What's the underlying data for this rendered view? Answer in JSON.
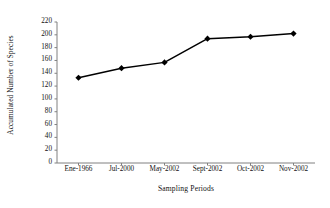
{
  "chart_data": {
    "type": "line",
    "title": "",
    "subtitle": "",
    "xlabel": "Sampling Periods",
    "ylabel": "Accumulated Number of Species",
    "categories": [
      "Ene-1966",
      "Jul-2000",
      "May-2002",
      "Sept-2002",
      "Oct-2002",
      "Nov-2002"
    ],
    "values": [
      133,
      148,
      157,
      194,
      197,
      202
    ],
    "series": [
      {
        "name": "Accumulated Number of Species",
        "values": [
          133,
          148,
          157,
          194,
          197,
          202
        ]
      }
    ],
    "ylim": [
      0,
      220
    ],
    "yticks": [
      0,
      20,
      40,
      60,
      80,
      100,
      120,
      140,
      160,
      180,
      200,
      220
    ],
    "ytick_labels": [
      "0",
      "20",
      "40",
      "60",
      "80",
      "100",
      "120",
      "140",
      "160",
      "180",
      "200",
      "220"
    ],
    "grid": false,
    "legend": false,
    "legend_position": "none",
    "marker": "diamond",
    "line_color": "#000000",
    "marker_color": "#000000",
    "axis_color": "#808080",
    "background_color": "#ffffff"
  }
}
